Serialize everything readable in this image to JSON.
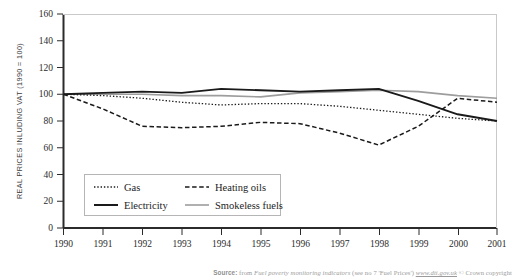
{
  "chart_data": {
    "type": "line",
    "title": "",
    "xlabel": "",
    "ylabel": "REAL PRICES INLUDING VAT (1990 = 100)",
    "xlim": [
      1990,
      2001
    ],
    "ylim": [
      0,
      160
    ],
    "ytick_step": 20,
    "grid": false,
    "legend_position": "inside-lower-left",
    "x": [
      1990,
      1991,
      1992,
      1993,
      1994,
      1995,
      1996,
      1997,
      1998,
      1999,
      2000,
      2001
    ],
    "xtick_labels": [
      "1990",
      "1991",
      "1992",
      "1993",
      "1994",
      "1995",
      "1996",
      "1997",
      "1998",
      "1999",
      "2000",
      "2001"
    ],
    "ytick_labels": [
      "0",
      "20",
      "40",
      "60",
      "80",
      "100",
      "120",
      "140",
      "160"
    ],
    "series": [
      {
        "name": "Gas",
        "style": "dotted",
        "color": "#1a1a1a",
        "values": [
          100,
          99,
          97,
          94,
          92,
          93,
          93,
          91,
          88,
          85,
          82,
          80
        ]
      },
      {
        "name": "Heating oils",
        "style": "dashed",
        "color": "#1a1a1a",
        "values": [
          100,
          89,
          76,
          75,
          76,
          79,
          78,
          71,
          62,
          76,
          97,
          94
        ]
      },
      {
        "name": "Electricity",
        "style": "solid",
        "color": "#1a1a1a",
        "values": [
          100,
          101,
          102,
          101,
          104,
          103,
          102,
          103,
          104,
          95,
          85,
          80
        ]
      },
      {
        "name": "Smokeless fuels",
        "style": "solid-grey",
        "color": "#9d9d9d",
        "values": [
          100,
          100,
          100,
          99,
          99,
          98,
          101,
          102,
          103,
          102,
          99,
          97
        ]
      }
    ]
  },
  "legend": {
    "items": [
      {
        "label": "Gas",
        "style": "dotted"
      },
      {
        "label": "Heating oils",
        "style": "dashed"
      },
      {
        "label": "Electricity",
        "style": "solid"
      },
      {
        "label": "Smokeless fuels",
        "style": "solid-grey"
      }
    ]
  },
  "source": {
    "label": "Source:",
    "prefix": " from ",
    "publication": "Fuel poverty monitoring indicators",
    "middle": " (see no 7 'Fuel Prices') ",
    "url": "www.dti.gov.uk",
    "suffix": " © Crown copyright"
  },
  "colors": {
    "axis": "#2b2b2b",
    "series_dark": "#1a1a1a",
    "series_grey": "#9d9d9d",
    "legend_border": "#b5b5b5",
    "source_text": "#9a9a9a"
  }
}
